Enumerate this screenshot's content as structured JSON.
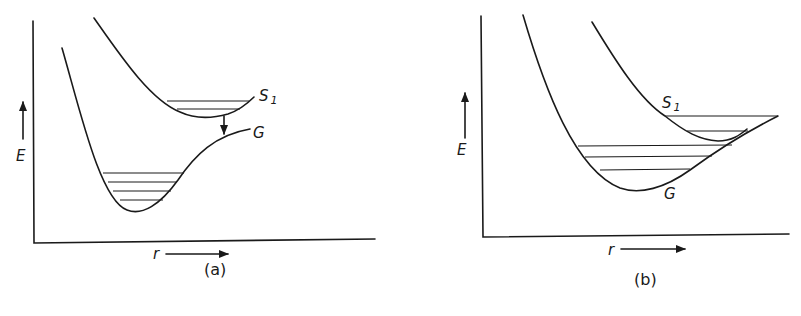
{
  "figure": {
    "panels": [
      {
        "id": "a",
        "caption": "(a)",
        "y_axis_label": "E",
        "x_axis_label": "r",
        "curves": [
          {
            "name": "S",
            "subscript": "1",
            "description": "excited-state potential curve with 2 vibrational levels"
          },
          {
            "name": "G",
            "subscript": "",
            "description": "ground-state potential curve with 4 vibrational levels"
          }
        ],
        "annotation": "downward arrow from S1 minimum to G curve"
      },
      {
        "id": "b",
        "caption": "(b)",
        "y_axis_label": "E",
        "x_axis_label": "r",
        "curves": [
          {
            "name": "S",
            "subscript": "1",
            "description": "excited-state potential curve crossing G with 2 vibrational levels"
          },
          {
            "name": "G",
            "subscript": "",
            "description": "ground-state potential curve with 3 vibrational levels"
          }
        ]
      }
    ],
    "colors": {
      "ink": "#1a1a1a",
      "background": "#ffffff"
    }
  }
}
